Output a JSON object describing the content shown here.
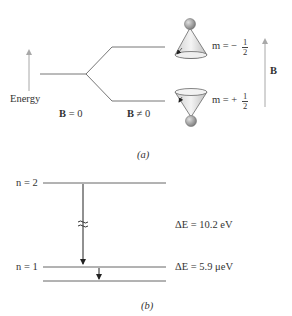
{
  "part_a": {
    "caption": "(a)",
    "energy_label": "Energy",
    "b_zero_bold": "B",
    "b_zero_rest": " = 0",
    "b_nonzero_bold": "B",
    "b_nonzero_rest": " ≠ 0",
    "field_label": "B",
    "upper_state": {
      "prefix": "m = −",
      "num": "1",
      "den": "2"
    },
    "lower_state": {
      "prefix": "m = +",
      "num": "1",
      "den": "2"
    }
  },
  "part_b": {
    "caption": "(b)",
    "level_n2": "n = 2",
    "level_n1": "n = 1",
    "delta_e_large": "ΔE = 10.2 eV",
    "delta_e_small": "ΔE = 5.9 μeV"
  },
  "colors": {
    "line": "#555555",
    "arrow_gray": "#a0a0a0",
    "cone_fill": "#e8e8e8",
    "ball": "#9a9a9a"
  }
}
